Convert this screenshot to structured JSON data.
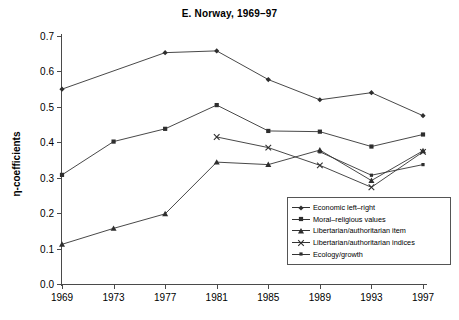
{
  "chart_data": {
    "type": "line",
    "title": "E. Norway, 1969–97",
    "xlabel": "",
    "ylabel": "η-coefficients",
    "categories": [
      "1969",
      "1973",
      "1977",
      "1981",
      "1985",
      "1989",
      "1993",
      "1997"
    ],
    "x": [
      1969,
      1973,
      1977,
      1981,
      1985,
      1989,
      1993,
      1997
    ],
    "ylim": [
      0.0,
      0.7
    ],
    "yticks": [
      "0.0",
      "0.1",
      "0.2",
      "0.3",
      "0.4",
      "0.5",
      "0.6",
      "0.7"
    ],
    "ytick_values": [
      0.0,
      0.1,
      0.2,
      0.3,
      0.4,
      0.5,
      0.6,
      0.7
    ],
    "grid": false,
    "legend_position": "lower-right",
    "series": [
      {
        "name": "Economic left–right",
        "marker": "diamond",
        "values": [
          0.55,
          null,
          0.653,
          0.658,
          0.577,
          0.52,
          0.54,
          0.475
        ]
      },
      {
        "name": "Moral–religious values",
        "marker": "square",
        "values": [
          0.308,
          0.402,
          0.438,
          0.505,
          0.432,
          0.43,
          0.388,
          0.422
        ]
      },
      {
        "name": "Libertarian/authoritarian item",
        "marker": "triangle",
        "values": [
          0.112,
          0.157,
          0.198,
          0.344,
          0.337,
          0.378,
          0.292,
          0.376
        ]
      },
      {
        "name": "Libertarian/authoritarian indices",
        "marker": "x",
        "values": [
          null,
          null,
          null,
          0.415,
          0.385,
          0.335,
          0.273,
          0.373
        ]
      },
      {
        "name": "Ecology/growth",
        "marker": "small-square",
        "values": [
          null,
          null,
          null,
          null,
          null,
          0.373,
          0.307,
          0.337
        ]
      }
    ]
  },
  "legend": {
    "items": [
      {
        "label": "Economic left–right",
        "marker": "diamond"
      },
      {
        "label": "Moral–religious values",
        "marker": "square"
      },
      {
        "label": "Libertarian/authoritarian item",
        "marker": "triangle"
      },
      {
        "label": "Libertarian/authoritarian indices",
        "marker": "x"
      },
      {
        "label": "Ecology/growth",
        "marker": "small-square"
      }
    ]
  },
  "colors": {
    "line": "#333333",
    "axis": "#4a4a4a",
    "background": "#ffffff"
  }
}
